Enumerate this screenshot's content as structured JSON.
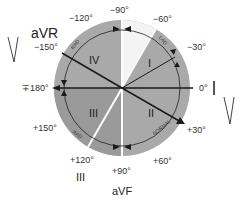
{
  "colors": {
    "circle_fill": "#a9a9a9",
    "quadrant_dark": "#8f8f8f",
    "white_sector": "#ffffff",
    "line": "#1a1a1a",
    "text": "#333333"
  },
  "angles": {
    "minus90": "−90°",
    "minus120": "−120°",
    "minus60": "−60°",
    "minus150": "−150°",
    "minus30": "−30°",
    "pm180": "∓180°",
    "zero": "0°",
    "plus150": "+150°",
    "plus30": "+30°",
    "plus120": "+120°",
    "plus60": "+60°",
    "plus90": "+90°"
  },
  "leads": {
    "aVR": "aVR",
    "I": "I",
    "III": "III",
    "aVF": "aVF"
  },
  "quadrants": {
    "I": "I",
    "II": "II",
    "III": "III",
    "IV": "IV"
  },
  "arcs": {
    "rad_upper": "RAD",
    "lad": "LAD",
    "normal": "NORMAL",
    "rad_lower": "RAD"
  }
}
